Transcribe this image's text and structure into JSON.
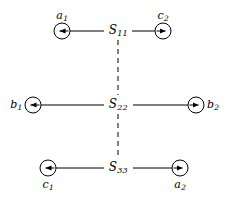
{
  "figure": {
    "width": 230,
    "height": 200,
    "background_color": "#ffffff",
    "stroke_color": "#000000",
    "type": "diagram"
  },
  "sites": [
    {
      "id": "S11",
      "label_main": "S",
      "label_sub": "11",
      "x": 118,
      "y": 31
    },
    {
      "id": "S22",
      "label_main": "S",
      "label_sub": "22",
      "x": 118,
      "y": 105
    },
    {
      "id": "S33",
      "label_main": "S",
      "label_sub": "33",
      "x": 118,
      "y": 168
    }
  ],
  "nodes": [
    {
      "id": "a1",
      "label_main": "a",
      "label_sub": "1",
      "cx": 62,
      "cy": 31,
      "r": 8,
      "arrow_direction": "left",
      "label_position": "above",
      "connects_to": "S11"
    },
    {
      "id": "c2",
      "label_main": "c",
      "label_sub": "2",
      "cx": 163,
      "cy": 31,
      "r": 8,
      "arrow_direction": "right",
      "label_position": "above",
      "connects_to": "S11"
    },
    {
      "id": "b1",
      "label_main": "b",
      "label_sub": "1",
      "cx": 33,
      "cy": 105,
      "r": 8,
      "arrow_direction": "left",
      "label_position": "left",
      "connects_to": "S22"
    },
    {
      "id": "b2",
      "label_main": "b",
      "label_sub": "2",
      "cx": 196,
      "cy": 105,
      "r": 8,
      "arrow_direction": "right",
      "label_position": "right",
      "connects_to": "S22"
    },
    {
      "id": "c1",
      "label_main": "c",
      "label_sub": "1",
      "cx": 48,
      "cy": 168,
      "r": 8,
      "arrow_direction": "left",
      "label_position": "below",
      "connects_to": "S33"
    },
    {
      "id": "a2",
      "label_main": "a",
      "label_sub": "2",
      "cx": 180,
      "cy": 168,
      "r": 8,
      "arrow_direction": "right",
      "label_position": "below",
      "connects_to": "S33"
    }
  ],
  "connectors": {
    "solid_lines": [
      {
        "id": "a1-S11",
        "x1": 70,
        "y1": 31,
        "x2": 104,
        "y2": 31
      },
      {
        "id": "S11-c2",
        "x1": 132,
        "y1": 31,
        "x2": 155,
        "y2": 31
      },
      {
        "id": "b1-S22",
        "x1": 41,
        "y1": 105,
        "x2": 104,
        "y2": 105
      },
      {
        "id": "S22-b2",
        "x1": 133,
        "y1": 105,
        "x2": 188,
        "y2": 105
      },
      {
        "id": "c1-S33",
        "x1": 56,
        "y1": 168,
        "x2": 104,
        "y2": 168
      },
      {
        "id": "S33-a2",
        "x1": 133,
        "y1": 168,
        "x2": 172,
        "y2": 168
      }
    ],
    "dashed_lines": [
      {
        "id": "S11-S22",
        "x1": 118,
        "y1": 40,
        "x2": 118,
        "y2": 95
      },
      {
        "id": "S22-S33",
        "x1": 118,
        "y1": 114,
        "x2": 118,
        "y2": 158
      }
    ],
    "dash_pattern": "5 4",
    "stroke_width": 1
  }
}
